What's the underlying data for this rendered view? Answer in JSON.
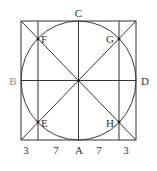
{
  "diagram": {
    "colors": {
      "stroke": "#333333",
      "label": "#333333",
      "label_muted": "#8a8a8a",
      "background": "#ffffff"
    },
    "points": {
      "top": {
        "label": "C",
        "x": 78,
        "y": 21
      },
      "left": {
        "label": "B",
        "x": 21,
        "y": 80
      },
      "right": {
        "label": "D",
        "x": 136,
        "y": 80
      },
      "bottom": {
        "label": "A",
        "x": 78,
        "y": 140
      },
      "upper_left": {
        "label": "F",
        "x": 38,
        "y": 39
      },
      "upper_right": {
        "label": "G",
        "x": 119,
        "y": 39
      },
      "lower_left": {
        "label": "E",
        "x": 38,
        "y": 122
      },
      "lower_right": {
        "label": "H",
        "x": 119,
        "y": 122
      },
      "center": {
        "label": "",
        "x": 78,
        "y": 80
      }
    },
    "bottom_segments": [
      {
        "label": "3",
        "position": "left-outer"
      },
      {
        "label": "7",
        "position": "left-inner"
      },
      {
        "label": "A",
        "position": "center"
      },
      {
        "label": "7",
        "position": "right-inner"
      },
      {
        "label": "3",
        "position": "right-outer"
      }
    ],
    "square": {
      "x": 21,
      "y": 21,
      "width": 115,
      "height": 119
    },
    "circle": {
      "cx": 78.5,
      "cy": 80.5,
      "rx": 57.5,
      "ry": 59.5
    },
    "inner_verticals": [
      38,
      119
    ]
  }
}
